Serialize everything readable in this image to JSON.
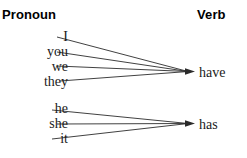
{
  "headers": {
    "left": "Pronoun",
    "right": "Verb"
  },
  "groups": [
    {
      "name": "plural-group",
      "verb": "have",
      "pronouns": [
        "I",
        "you",
        "we",
        "they"
      ]
    },
    {
      "name": "singular-group",
      "verb": "has",
      "pronouns": [
        "he",
        "she",
        "it"
      ]
    }
  ],
  "colors": {
    "background": "#ffffff",
    "text": "#1b1b1b",
    "header_text": "#000000",
    "line": "#2b2b2b"
  },
  "diagram": {
    "type": "mapping-diagram",
    "left_column_label": "Pronoun",
    "right_column_label": "Verb",
    "mappings": [
      {
        "from": "I",
        "to": "have"
      },
      {
        "from": "you",
        "to": "have"
      },
      {
        "from": "we",
        "to": "have"
      },
      {
        "from": "they",
        "to": "have"
      },
      {
        "from": "he",
        "to": "has"
      },
      {
        "from": "she",
        "to": "has"
      },
      {
        "from": "it",
        "to": "has"
      }
    ]
  }
}
